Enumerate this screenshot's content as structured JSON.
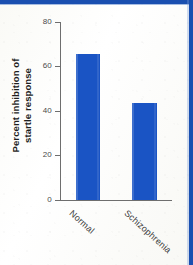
{
  "figure": {
    "background_color": "#fdfdfb",
    "banner_color": "#1a4fb0",
    "bar_color": "#1a54c4",
    "axis_color": "#6e6e6e"
  },
  "chart_data": {
    "type": "bar",
    "title": "",
    "xlabel": "",
    "ylabel_line1": "Percent inhibition of",
    "ylabel_line2": "startle response",
    "categories": [
      "Normal",
      "Schizophrenia"
    ],
    "values": [
      65.5,
      43.5
    ],
    "ylim": [
      0,
      80
    ],
    "yticks": [
      0,
      20,
      40,
      60,
      80
    ],
    "ytick_labels": [
      "0",
      "20",
      "40",
      "60",
      "80"
    ],
    "grid": false,
    "legend": "none",
    "series": [
      {
        "name": "Percent inhibition of startle response",
        "values": [
          65.5,
          43.5
        ],
        "color": "#1a54c4"
      }
    ]
  }
}
